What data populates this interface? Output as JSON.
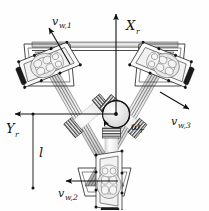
{
  "figure": {
    "background_color": "#fefefe",
    "line_color": "#111111"
  },
  "axes": {
    "x_axis": {
      "label": "X",
      "subscript": "r",
      "direction": "up",
      "origin_x": 116,
      "origin_y": 114,
      "tip_x": 116,
      "tip_y": 12
    },
    "y_axis": {
      "label": "Y",
      "subscript": "r",
      "direction": "left",
      "origin_x": 116,
      "origin_y": 114,
      "tip_x": 13,
      "tip_y": 114
    },
    "rotation": {
      "label": "ω",
      "subscript": "r",
      "description": "body rotation rate about center"
    }
  },
  "dimension": {
    "label": "l",
    "description": "distance from robot center axis to bottom wheel module",
    "top_y": 114,
    "bottom_y": 188,
    "x": 33
  },
  "wheels": [
    {
      "id": "wheel-1",
      "label": "v",
      "subscript": "w,1",
      "position": "top-left",
      "arrow_direction": "up-left",
      "arrow_tail_x": 68,
      "arrow_tail_y": 62,
      "arrow_tip_x": 48,
      "arrow_tip_y": 27,
      "label_x": 51,
      "label_y": 24
    },
    {
      "id": "wheel-2",
      "label": "v",
      "subscript": "w,2",
      "position": "bottom-center",
      "arrow_direction": "left",
      "arrow_tail_x": 118,
      "arrow_tail_y": 181,
      "arrow_tip_x": 66,
      "arrow_tip_y": 181,
      "label_x": 61,
      "label_y": 196
    },
    {
      "id": "wheel-3",
      "label": "v",
      "subscript": "w,3",
      "position": "right",
      "arrow_direction": "down-right",
      "arrow_tail_x": 160,
      "arrow_tail_y": 92,
      "arrow_tip_x": 189,
      "arrow_tip_y": 108,
      "label_x": 170,
      "label_y": 124
    }
  ],
  "suspension": {
    "count": 3,
    "element": "dual coil spring with connecting rod",
    "description": "each wheel module links to the central hub through two coil springs in series"
  },
  "chassis": {
    "shape": "inverted triangle frame",
    "members": "paired aluminium extrusion rails with bolted corner plates"
  }
}
